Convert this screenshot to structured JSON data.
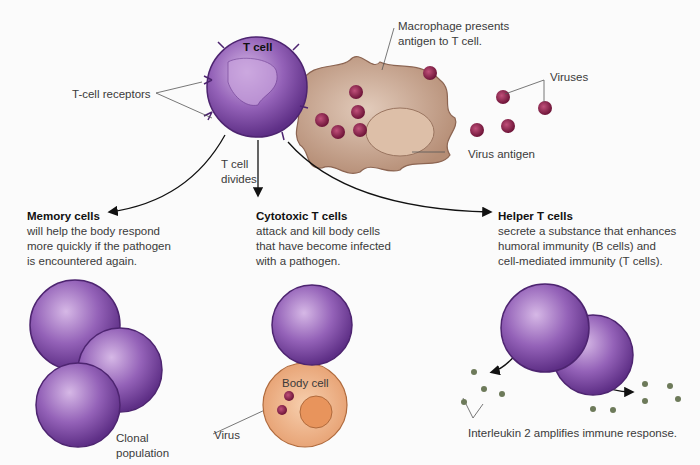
{
  "figure": {
    "tcell_label": "T cell",
    "tcell_receptors_label": "T-cell receptors",
    "macrophage_label_line1": "Macrophage presents",
    "macrophage_label_line2": "antigen to T cell.",
    "viruses_label": "Viruses",
    "virus_antigen_label": "Virus antigen",
    "divides_line1": "T cell",
    "divides_line2": "divides",
    "memory": {
      "title": "Memory cells",
      "lines": [
        "will help the body respond",
        "more quickly if the pathogen",
        "is encountered again."
      ],
      "sublabel_line1": "Clonal",
      "sublabel_line2": "population"
    },
    "cytotoxic": {
      "title": "Cytotoxic T cells",
      "lines": [
        "attack and kill body cells",
        "that have become infected",
        "with a pathogen."
      ],
      "body_cell_label": "Body cell",
      "virus_label": "Virus"
    },
    "helper": {
      "title": "Helper T cells",
      "lines": [
        "secrete a substance that enhances",
        "humoral immunity (B cells) and",
        "cell-mediated immunity (T cells)."
      ],
      "interleukin_label": "Interleukin 2 amplifies immune response."
    },
    "colors": {
      "tcell": "#7a4a9e",
      "tcell_light": "#b38ccf",
      "macrophage": "#c9a690",
      "virus": "#8a1f4a",
      "body_cell": "#f0b58a",
      "interleukin": "#6d7a5a"
    }
  }
}
